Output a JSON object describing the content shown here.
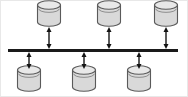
{
  "diagram": {
    "title": "Shared bus architecture with six storage nodes",
    "type": "node-bus-diagram",
    "canvas": {
      "width": 188,
      "height": 97,
      "background": "#ffffff",
      "border_color": "#e8e8e8"
    },
    "bus": {
      "label": "shared-bus",
      "x1": 8,
      "x2": 178,
      "y": 50.5,
      "thickness": 3,
      "color": "#1a1a1a"
    },
    "cylinder_style": {
      "body_fill": "#d9d9d9",
      "top_fill": "#e8e8e8",
      "stroke": "#5a5a5a",
      "stroke_width": 1.1,
      "width": 23,
      "body_height": 17,
      "ellipse_ry": 4.2
    },
    "arrow_style": {
      "color": "#141414",
      "line_width": 1.4,
      "head_width": 5,
      "head_length": 5,
      "double_headed": true
    },
    "nodes": [
      {
        "id": "top-1",
        "label": "Storage node top 1",
        "row": "top",
        "cx": 49,
        "top_y": 5,
        "arrow_from": 27,
        "arrow_to": 49
      },
      {
        "id": "top-2",
        "label": "Storage node top 2",
        "row": "top",
        "cx": 109,
        "top_y": 5,
        "arrow_from": 27,
        "arrow_to": 49
      },
      {
        "id": "top-3",
        "label": "Storage node top 3",
        "row": "top",
        "cx": 166,
        "top_y": 5,
        "arrow_from": 27,
        "arrow_to": 49
      },
      {
        "id": "bottom-1",
        "label": "Storage node bottom 1",
        "row": "bottom",
        "cx": 29,
        "top_y": 70,
        "arrow_from": 52,
        "arrow_to": 69
      },
      {
        "id": "bottom-2",
        "label": "Storage node bottom 2",
        "row": "bottom",
        "cx": 84,
        "top_y": 70,
        "arrow_from": 52,
        "arrow_to": 69
      },
      {
        "id": "bottom-3",
        "label": "Storage node bottom 3",
        "row": "bottom",
        "cx": 139,
        "top_y": 70,
        "arrow_from": 52,
        "arrow_to": 69
      }
    ]
  }
}
